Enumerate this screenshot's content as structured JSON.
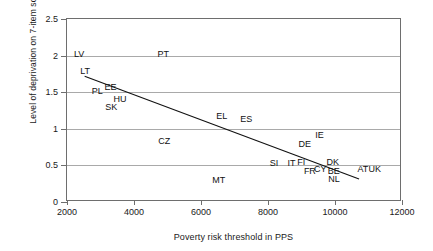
{
  "chart_data": {
    "type": "scatter",
    "title": "",
    "xlabel": "Poverty risk threshold in PPS",
    "ylabel": "Level of deprivation on 7-item scale",
    "xlim": [
      2000,
      12000
    ],
    "ylim": [
      0,
      2.5
    ],
    "xticks": [
      "2000",
      "4000",
      "6000",
      "8000",
      "10000",
      "12000"
    ],
    "yticks": [
      "0",
      "0.5",
      "1",
      "1.5",
      "2",
      "2.5"
    ],
    "grid": "horizontal",
    "legend": "none",
    "point_style": "text-label-only",
    "points": [
      {
        "label": "LV",
        "x": 2360,
        "y": 2.02
      },
      {
        "label": "PT",
        "x": 4870,
        "y": 2.02
      },
      {
        "label": "LT",
        "x": 2540,
        "y": 1.79
      },
      {
        "label": "PL",
        "x": 2900,
        "y": 1.51
      },
      {
        "label": "EE",
        "x": 3300,
        "y": 1.57
      },
      {
        "label": "HU",
        "x": 3580,
        "y": 1.41
      },
      {
        "label": "SK",
        "x": 3320,
        "y": 1.3
      },
      {
        "label": "EL",
        "x": 6620,
        "y": 1.18
      },
      {
        "label": "ES",
        "x": 7350,
        "y": 1.13
      },
      {
        "label": "CZ",
        "x": 4900,
        "y": 0.84
      },
      {
        "label": "IE",
        "x": 9540,
        "y": 0.92
      },
      {
        "label": "DE",
        "x": 9100,
        "y": 0.79
      },
      {
        "label": "SI",
        "x": 8180,
        "y": 0.53
      },
      {
        "label": "IT",
        "x": 8700,
        "y": 0.53
      },
      {
        "label": "FI",
        "x": 8990,
        "y": 0.54
      },
      {
        "label": "DK",
        "x": 9930,
        "y": 0.54
      },
      {
        "label": "AT",
        "x": 10830,
        "y": 0.45
      },
      {
        "label": "UK",
        "x": 11190,
        "y": 0.45
      },
      {
        "label": "FR",
        "x": 9250,
        "y": 0.42
      },
      {
        "label": "CY",
        "x": 9560,
        "y": 0.45
      },
      {
        "label": "BE",
        "x": 9960,
        "y": 0.42
      },
      {
        "label": "NL",
        "x": 9970,
        "y": 0.31
      },
      {
        "label": "MT",
        "x": 6530,
        "y": 0.3
      }
    ],
    "trendline": {
      "x_start": 2530,
      "y_start": 1.71,
      "x_end": 10770,
      "y_end": 0.29
    }
  }
}
